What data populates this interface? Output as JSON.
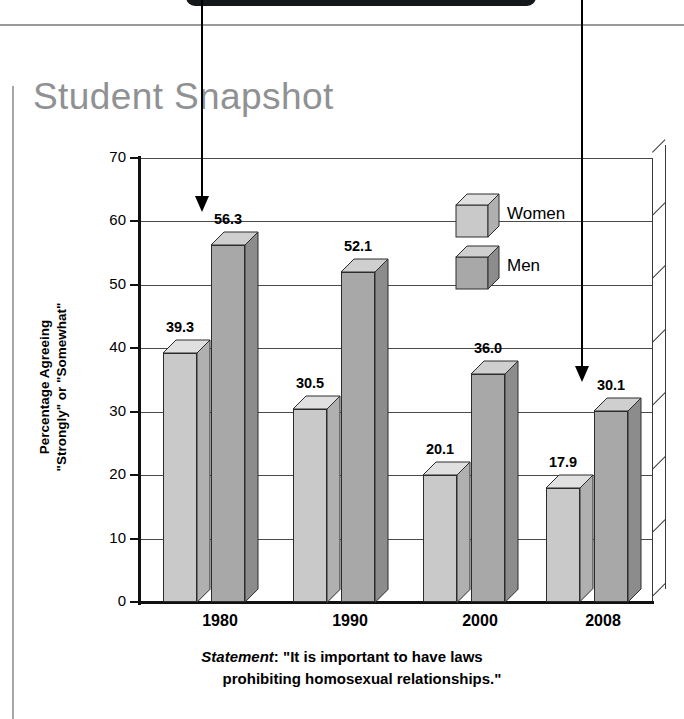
{
  "title": "Student Snapshot",
  "chart_data": {
    "type": "bar",
    "title": "Student Snapshot",
    "categories": [
      "1980",
      "1990",
      "2000",
      "2008"
    ],
    "series": [
      {
        "name": "Women",
        "values": [
          39.3,
          30.5,
          20.1,
          17.9
        ],
        "color": "#c9c9c9"
      },
      {
        "name": "Men",
        "values": [
          56.3,
          52.1,
          36.0,
          30.1
        ],
        "color": "#a8a8a8"
      }
    ],
    "ylabel_line1": "Percentage Agreeing",
    "ylabel_line2": "\"Strongly\" or \"Somewhat\"",
    "xlabel": "",
    "ylim": [
      0,
      70
    ],
    "ytick_labels": [
      "70",
      "60",
      "50",
      "40",
      "30",
      "20",
      "10",
      "0"
    ],
    "ytick_values": [
      70,
      60,
      50,
      40,
      30,
      20,
      10,
      0
    ],
    "grid": true,
    "legend_position": "inside-top-right",
    "data_labels": [
      "39.3",
      "56.3",
      "30.5",
      "52.1",
      "20.1",
      "36.0",
      "17.9",
      "30.1"
    ]
  },
  "legend": [
    {
      "label": "Women"
    },
    {
      "label": "Men"
    }
  ],
  "caption": {
    "statement_label": "Statement",
    "colon": ": ",
    "line1": "\"It is important to have laws",
    "line2": "prohibiting homosexual relationships.\""
  },
  "annotations": [
    {
      "name": "arrow-left",
      "icon": "arrow-down-icon"
    },
    {
      "name": "arrow-right",
      "icon": "arrow-down-icon"
    }
  ],
  "colors": {
    "title_gray": "#8f9193",
    "women_front": "#c9c9c9",
    "women_top": "#e0e0e0",
    "women_side": "#b0b0b0",
    "men_front": "#a8a8a8",
    "men_top": "#cfcfcf",
    "men_side": "#8c8c8c",
    "outline": "#2c2c2c",
    "rule": "#9a9a9a"
  }
}
